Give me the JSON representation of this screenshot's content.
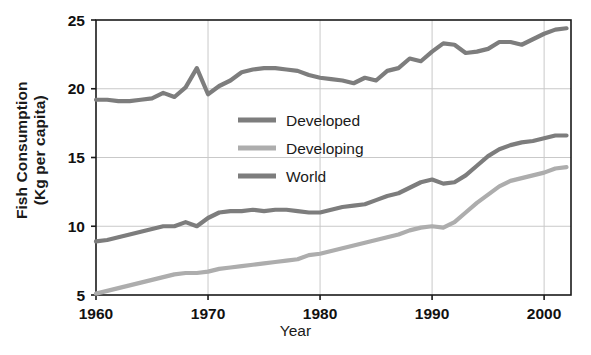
{
  "chart_data": {
    "type": "line",
    "title": "",
    "xlabel": "Year",
    "ylabel": "Fish Consumption (Kg per capita)",
    "ylabel_line1": "Fish Consumption",
    "ylabel_line2": "(Kg per capita)",
    "xlim": [
      1960,
      2002.4
    ],
    "ylim": [
      5,
      25
    ],
    "xticks": [
      1960,
      1970,
      1980,
      1990,
      2000
    ],
    "xtick_labels": [
      "1960",
      "1970",
      "1980",
      "1990",
      "2000"
    ],
    "yticks": [
      5,
      10,
      15,
      20,
      25
    ],
    "ytick_labels": [
      "5",
      "10",
      "15",
      "20",
      "25"
    ],
    "grid": "both-light-gray",
    "legend_position": "center-left-inside",
    "legend": [
      {
        "label": "Developed",
        "color": "#7d7d7d"
      },
      {
        "label": "Developing",
        "color": "#adadad"
      },
      {
        "label": "World",
        "color": "#7d7d7d"
      }
    ],
    "x": [
      1960,
      1961,
      1962,
      1963,
      1964,
      1965,
      1966,
      1967,
      1968,
      1969,
      1970,
      1971,
      1972,
      1973,
      1974,
      1975,
      1976,
      1977,
      1978,
      1979,
      1980,
      1981,
      1982,
      1983,
      1984,
      1985,
      1986,
      1987,
      1988,
      1989,
      1990,
      1991,
      1992,
      1993,
      1994,
      1995,
      1996,
      1997,
      1998,
      1999,
      2000,
      2001,
      2002
    ],
    "series": [
      {
        "name": "Developed",
        "color": "#7d7d7d",
        "values": [
          19.2,
          19.2,
          19.1,
          19.1,
          19.2,
          19.3,
          19.7,
          19.4,
          20.1,
          21.5,
          19.6,
          20.2,
          20.6,
          21.2,
          21.4,
          21.5,
          21.5,
          21.4,
          21.3,
          21.0,
          20.8,
          20.7,
          20.6,
          20.4,
          20.8,
          20.6,
          21.3,
          21.5,
          22.2,
          22.0,
          22.7,
          23.3,
          23.2,
          22.6,
          22.7,
          22.9,
          23.4,
          23.4,
          23.2,
          23.6,
          24.0,
          24.3,
          24.4
        ]
      },
      {
        "name": "Developing",
        "color": "#adadad",
        "values": [
          5.1,
          5.3,
          5.5,
          5.7,
          5.9,
          6.1,
          6.3,
          6.5,
          6.6,
          6.6,
          6.7,
          6.9,
          7.0,
          7.1,
          7.2,
          7.3,
          7.4,
          7.5,
          7.6,
          7.9,
          8.0,
          8.2,
          8.4,
          8.6,
          8.8,
          9.0,
          9.2,
          9.4,
          9.7,
          9.9,
          10.0,
          9.9,
          10.3,
          11.0,
          11.7,
          12.3,
          12.9,
          13.3,
          13.5,
          13.7,
          13.9,
          14.2,
          14.3
        ]
      },
      {
        "name": "World",
        "color": "#7d7d7d",
        "values": [
          8.9,
          9.0,
          9.2,
          9.4,
          9.6,
          9.8,
          10.0,
          10.0,
          10.3,
          10.0,
          10.6,
          11.0,
          11.1,
          11.1,
          11.2,
          11.1,
          11.2,
          11.2,
          11.1,
          11.0,
          11.0,
          11.2,
          11.4,
          11.5,
          11.6,
          11.9,
          12.2,
          12.4,
          12.8,
          13.2,
          13.4,
          13.1,
          13.2,
          13.7,
          14.4,
          15.1,
          15.6,
          15.9,
          16.1,
          16.2,
          16.4,
          16.6,
          16.6
        ]
      }
    ]
  }
}
